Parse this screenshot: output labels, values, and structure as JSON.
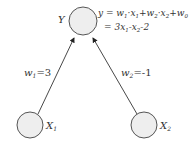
{
  "nodes": {
    "output": {
      "label": "Y",
      "sub": ""
    },
    "input1": {
      "label": "X",
      "sub": "1"
    },
    "input2": {
      "label": "X",
      "sub": "2"
    }
  },
  "edges": {
    "e1": {
      "label": "w",
      "sub": "1",
      "value": "=3"
    },
    "e2": {
      "label": "w",
      "sub": "2",
      "value": "=-1"
    }
  },
  "equation": {
    "line1": [
      "y = w",
      "1",
      "·x",
      "1",
      "+w",
      "2",
      "·x",
      "2",
      "+w",
      "0"
    ],
    "line2": [
      "= 3x",
      "1",
      "-x",
      "2",
      "-2"
    ]
  },
  "colors": {
    "node_fill": "#eeeeee",
    "node_stroke": "#555555",
    "edge": "#333333",
    "text": "#333333"
  }
}
